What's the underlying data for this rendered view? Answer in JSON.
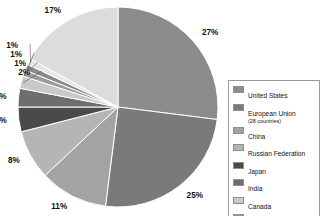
{
  "chart_data": {
    "type": "pie",
    "title": "",
    "labels": [
      "United States",
      "European Union (28 countries)",
      "China",
      "Russian Federation",
      "Japan",
      "India",
      "Canada",
      "Mexico",
      "Brazil",
      "Indonesia",
      "Rest of the world"
    ],
    "values": [
      27,
      25,
      11,
      8,
      4,
      3,
      2,
      1,
      1,
      1,
      17
    ],
    "value_labels": [
      "27%",
      "25%",
      "11%",
      "8%",
      "4%",
      "3%",
      "2%",
      "1%",
      "1%",
      "1%",
      "17%"
    ],
    "colors": [
      "#8c8c8c",
      "#7a7a7a",
      "#a3a3a3",
      "#b5b5b5",
      "#4a4a4a",
      "#6e6e6e",
      "#c9c9c9",
      "#9a9a9a",
      "#8a8a8a",
      "#e6e6e6",
      "#dcdcdc"
    ],
    "start_angle": 0,
    "direction": "clockwise",
    "legend_position": "right",
    "grid": false
  },
  "legend": {
    "items": [
      {
        "label": "United States",
        "sub": "",
        "color": "#8c8c8c"
      },
      {
        "label": "European Union",
        "sub": "(28 countries)",
        "color": "#7a7a7a"
      },
      {
        "label": "China",
        "sub": "",
        "color": "#a3a3a3"
      },
      {
        "label": "Russian Federation",
        "sub": "",
        "color": "#b5b5b5"
      },
      {
        "label": "Japan",
        "sub": "",
        "color": "#4a4a4a"
      },
      {
        "label": "India",
        "sub": "",
        "color": "#6e6e6e"
      },
      {
        "label": "Canada",
        "sub": "",
        "color": "#c9c9c9"
      },
      {
        "label": "Mexico",
        "sub": "",
        "color": "#9a9a9a"
      },
      {
        "label": "Brazil",
        "sub": "",
        "color": "#8a8a8a"
      },
      {
        "label": "Indonesia",
        "sub": "",
        "color": "#e6e6e6"
      },
      {
        "label": "Rest of the world",
        "sub": "",
        "color": "#dcdcdc"
      }
    ]
  },
  "geometry": {
    "cx": 118,
    "cy": 107,
    "r": 100,
    "label_radius": 112
  }
}
